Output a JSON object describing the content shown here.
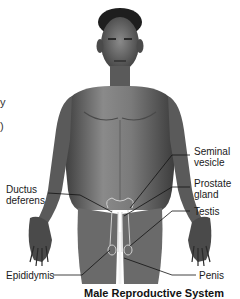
{
  "figure": {
    "title": "Male Reproductive System",
    "colors": {
      "background": "#ffffff",
      "skin_dark": "#3a3a3a",
      "skin_mid": "#6e6e6e",
      "skin_light": "#a8a8a8",
      "line": "#111111"
    }
  },
  "edge_fragments": [
    "y",
    ")"
  ],
  "labels": [
    {
      "id": "seminal-vesicle",
      "text": "Seminal\nvesicle"
    },
    {
      "id": "prostate-gland",
      "text": "Prostate\ngland"
    },
    {
      "id": "testis",
      "text": "Testis"
    },
    {
      "id": "ductus-deferens",
      "text": "Ductus\ndeferens"
    },
    {
      "id": "epididymis",
      "text": "Epididymis"
    },
    {
      "id": "penis",
      "text": "Penis"
    }
  ]
}
